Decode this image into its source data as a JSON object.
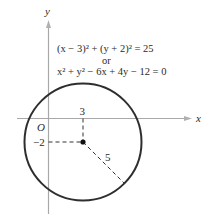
{
  "diagram": {
    "type": "circle-on-coordinate-plane",
    "axes": {
      "x_label": "x",
      "y_label": "y",
      "origin_label": "O",
      "axis_color": "#a8a8a8"
    },
    "circle": {
      "center": [
        3,
        -2
      ],
      "radius": 5,
      "stroke_color": "#2e2e2e"
    },
    "labels": {
      "center_x_tick": "3",
      "center_y_tick": "−2",
      "radius_label": "5"
    },
    "equations": {
      "standard_form": "(x − 3)² + (y + 2)² = 25",
      "connector": "or",
      "general_form": "x² + y² − 6x + 4y − 12 = 0"
    }
  }
}
